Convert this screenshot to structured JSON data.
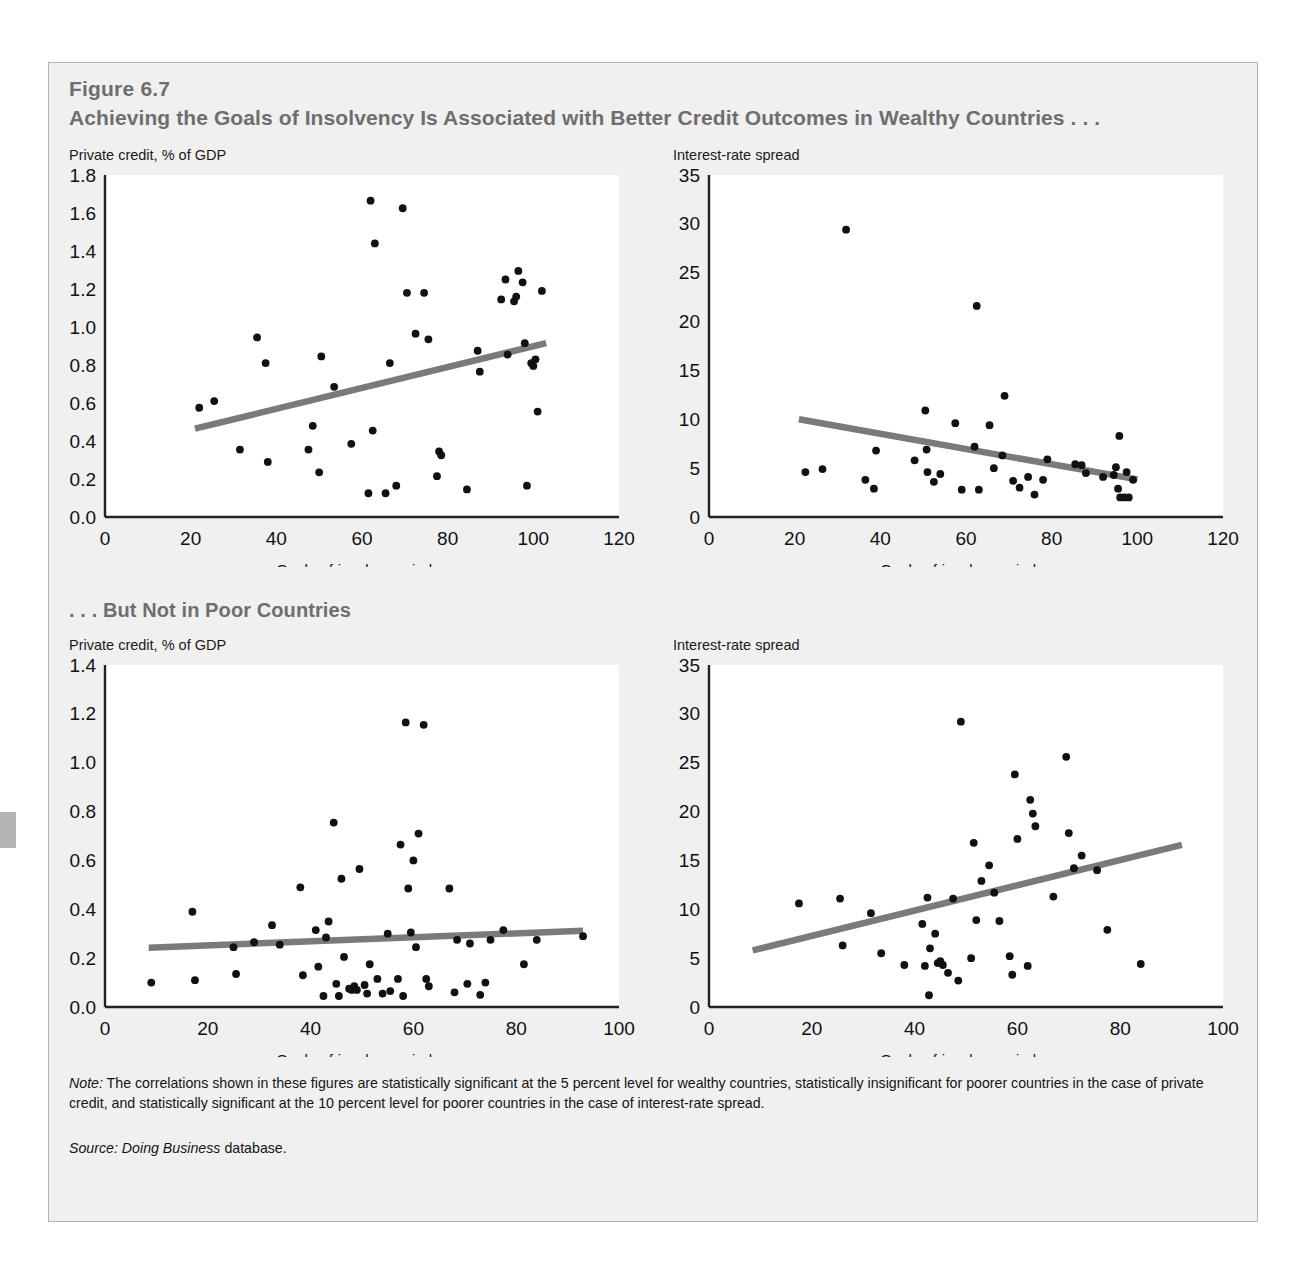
{
  "figure": {
    "number": "Figure 6.7",
    "title": "Achieving the Goals of Insolvency Is Associated with Better Credit Outcomes in Wealthy Countries . . .",
    "section_title": ". . . But Not in Poor Countries",
    "note_label": "Note:",
    "note_text": " The correlations shown in these figures are statistically significant at the 5 percent level for wealthy countries, statistically insignificant for poorer countries in the case of private credit, and statistically significant at the 10 percent level for poorer countries in the case of interest-rate spread.",
    "source_label": "Source:",
    "source_italic": " Doing Business",
    "source_text": " database."
  },
  "colors": {
    "panel_bg": "#f0f0f0",
    "panel_border": "#b3b3b3",
    "heading": "#6e6e6e",
    "axis": "#222222",
    "point": "#111111",
    "trendline": "#7a7a7a",
    "plot_bg": "#ffffff"
  },
  "chart_data": [
    {
      "id": "wealthy-private-credit",
      "type": "scatter",
      "title": "Private credit, % of GDP",
      "panel": "top-left",
      "xlabel": "Goals-of-insolvency index",
      "ylabel": "Private credit, % of GDP",
      "xlim": [
        0,
        120
      ],
      "ylim": [
        0,
        1.8
      ],
      "xticks": [
        0,
        20,
        40,
        60,
        80,
        100,
        120
      ],
      "yticks": [
        "0.0",
        "0.2",
        "0.4",
        "0.6",
        "0.8",
        "1.0",
        "1.2",
        "1.4",
        "1.6",
        "1.8"
      ],
      "grid": false,
      "legend": "none",
      "trendline": {
        "x0": 21,
        "y0": 0.465,
        "x1": 103,
        "y1": 0.915
      },
      "points": [
        [
          22,
          0.575
        ],
        [
          25.5,
          0.61
        ],
        [
          31.5,
          0.355
        ],
        [
          35.5,
          0.945
        ],
        [
          37.5,
          0.81
        ],
        [
          38,
          0.29
        ],
        [
          47.5,
          0.355
        ],
        [
          48.5,
          0.48
        ],
        [
          50,
          0.235
        ],
        [
          50.5,
          0.845
        ],
        [
          53.5,
          0.685
        ],
        [
          57.5,
          0.385
        ],
        [
          61.5,
          0.125
        ],
        [
          62,
          1.665
        ],
        [
          62.5,
          0.455
        ],
        [
          63,
          1.44
        ],
        [
          65.5,
          0.125
        ],
        [
          66.5,
          0.81
        ],
        [
          68,
          0.165
        ],
        [
          69.5,
          1.625
        ],
        [
          70.5,
          1.18
        ],
        [
          72.5,
          0.965
        ],
        [
          74.5,
          1.18
        ],
        [
          75.5,
          0.935
        ],
        [
          77.5,
          0.215
        ],
        [
          78,
          0.345
        ],
        [
          78.5,
          0.325
        ],
        [
          84.5,
          0.145
        ],
        [
          87,
          0.875
        ],
        [
          87.5,
          0.765
        ],
        [
          92.5,
          1.145
        ],
        [
          93.5,
          1.25
        ],
        [
          94,
          0.855
        ],
        [
          95.5,
          1.135
        ],
        [
          96,
          1.16
        ],
        [
          96.5,
          1.295
        ],
        [
          97.5,
          1.235
        ],
        [
          98,
          0.915
        ],
        [
          98.5,
          0.165
        ],
        [
          99.5,
          0.81
        ],
        [
          100,
          0.795
        ],
        [
          100.5,
          0.83
        ],
        [
          101,
          0.555
        ],
        [
          102,
          1.19
        ]
      ]
    },
    {
      "id": "wealthy-interest-rate-spread",
      "type": "scatter",
      "title": "Interest-rate spread",
      "panel": "top-right",
      "xlabel": "Goals-of-insolvency index",
      "ylabel": "Interest-rate spread",
      "xlim": [
        0,
        120
      ],
      "ylim": [
        0,
        35
      ],
      "xticks": [
        0,
        20,
        40,
        60,
        80,
        100,
        120
      ],
      "yticks": [
        0,
        5,
        10,
        15,
        20,
        25,
        30,
        35
      ],
      "grid": false,
      "legend": "none",
      "trendline": {
        "x0": 21,
        "y0": 10.0,
        "x1": 100,
        "y1": 3.85
      },
      "points": [
        [
          22.5,
          4.6
        ],
        [
          26.5,
          4.9
        ],
        [
          32,
          29.4
        ],
        [
          36.5,
          3.8
        ],
        [
          38.5,
          2.9
        ],
        [
          39,
          6.8
        ],
        [
          48,
          5.8
        ],
        [
          50.5,
          10.9
        ],
        [
          50.8,
          6.9
        ],
        [
          51,
          4.6
        ],
        [
          52.5,
          3.6
        ],
        [
          54,
          4.4
        ],
        [
          57.5,
          9.6
        ],
        [
          59,
          2.8
        ],
        [
          62,
          7.2
        ],
        [
          62.5,
          21.6
        ],
        [
          63,
          2.8
        ],
        [
          65.5,
          9.4
        ],
        [
          66.5,
          5.0
        ],
        [
          68.5,
          6.3
        ],
        [
          69,
          12.4
        ],
        [
          71,
          3.7
        ],
        [
          72.5,
          3.0
        ],
        [
          74.5,
          4.1
        ],
        [
          76,
          2.3
        ],
        [
          78,
          3.8
        ],
        [
          79,
          5.9
        ],
        [
          85.5,
          5.4
        ],
        [
          87,
          5.3
        ],
        [
          88,
          4.5
        ],
        [
          92,
          4.1
        ],
        [
          94.5,
          4.3
        ],
        [
          95,
          5.1
        ],
        [
          95.5,
          2.9
        ],
        [
          95.8,
          8.3
        ],
        [
          96,
          2.0
        ],
        [
          97,
          2.0
        ],
        [
          97.5,
          4.6
        ],
        [
          98,
          2.0
        ],
        [
          99,
          3.8
        ]
      ]
    },
    {
      "id": "poor-private-credit",
      "type": "scatter",
      "title": "Private credit, % of GDP",
      "panel": "bottom-left",
      "xlabel": "Goals-of-insolvency index",
      "ylabel": "Private credit, % of GDP",
      "xlim": [
        0,
        100
      ],
      "ylim": [
        0,
        1.4
      ],
      "xticks": [
        0,
        20,
        40,
        60,
        80,
        100
      ],
      "yticks": [
        "0.0",
        "0.2",
        "0.4",
        "0.6",
        "0.8",
        "1.0",
        "1.2",
        "1.4"
      ],
      "grid": false,
      "legend": "none",
      "trendline": {
        "x0": 8.5,
        "y0": 0.243,
        "x1": 93,
        "y1": 0.312
      },
      "points": [
        [
          9,
          0.1
        ],
        [
          17,
          0.39
        ],
        [
          17.5,
          0.11
        ],
        [
          25,
          0.245
        ],
        [
          25.5,
          0.135
        ],
        [
          29,
          0.265
        ],
        [
          32.5,
          0.335
        ],
        [
          34,
          0.255
        ],
        [
          38,
          0.49
        ],
        [
          38.5,
          0.13
        ],
        [
          41,
          0.315
        ],
        [
          41.5,
          0.165
        ],
        [
          42.5,
          0.045
        ],
        [
          43,
          0.285
        ],
        [
          43.5,
          0.35
        ],
        [
          44.5,
          0.755
        ],
        [
          45,
          0.095
        ],
        [
          45.5,
          0.045
        ],
        [
          46,
          0.525
        ],
        [
          46.5,
          0.205
        ],
        [
          47.5,
          0.075
        ],
        [
          48,
          0.07
        ],
        [
          48.5,
          0.085
        ],
        [
          49,
          0.07
        ],
        [
          49.5,
          0.565
        ],
        [
          50.5,
          0.09
        ],
        [
          51,
          0.055
        ],
        [
          51.5,
          0.175
        ],
        [
          53,
          0.115
        ],
        [
          54,
          0.055
        ],
        [
          55,
          0.3
        ],
        [
          55.5,
          0.065
        ],
        [
          57,
          0.115
        ],
        [
          57.5,
          0.665
        ],
        [
          58,
          0.045
        ],
        [
          58.5,
          1.165
        ],
        [
          59,
          0.485
        ],
        [
          59.5,
          0.305
        ],
        [
          60,
          0.6
        ],
        [
          60.5,
          0.245
        ],
        [
          61,
          0.71
        ],
        [
          62,
          1.155
        ],
        [
          62.5,
          0.115
        ],
        [
          63,
          0.085
        ],
        [
          67,
          0.485
        ],
        [
          68,
          0.06
        ],
        [
          68.5,
          0.275
        ],
        [
          70.5,
          0.095
        ],
        [
          71,
          0.26
        ],
        [
          73,
          0.05
        ],
        [
          74,
          0.1
        ],
        [
          75,
          0.275
        ],
        [
          77.5,
          0.315
        ],
        [
          81.5,
          0.175
        ],
        [
          84,
          0.275
        ],
        [
          93,
          0.29
        ]
      ]
    },
    {
      "id": "poor-interest-rate-spread",
      "type": "scatter",
      "title": "Interest-rate spread",
      "panel": "bottom-right",
      "xlabel": "Goals-of-insolvency index",
      "ylabel": "Interest-rate spread",
      "xlim": [
        0,
        100
      ],
      "ylim": [
        0,
        35
      ],
      "xticks": [
        0,
        20,
        40,
        60,
        80,
        100
      ],
      "yticks": [
        0,
        5,
        10,
        15,
        20,
        25,
        30,
        35
      ],
      "grid": false,
      "legend": "none",
      "trendline": {
        "x0": 8.5,
        "y0": 5.8,
        "x1": 92,
        "y1": 16.6
      },
      "points": [
        [
          17.5,
          10.6
        ],
        [
          25.5,
          11.1
        ],
        [
          26,
          6.3
        ],
        [
          31.5,
          9.6
        ],
        [
          33.5,
          5.5
        ],
        [
          38,
          4.3
        ],
        [
          41.5,
          8.5
        ],
        [
          42,
          4.2
        ],
        [
          42.5,
          11.2
        ],
        [
          42.8,
          1.2
        ],
        [
          43,
          6.0
        ],
        [
          44,
          7.5
        ],
        [
          44.5,
          4.5
        ],
        [
          45,
          4.7
        ],
        [
          45.5,
          4.3
        ],
        [
          46.5,
          3.5
        ],
        [
          47.5,
          11.1
        ],
        [
          48.5,
          2.7
        ],
        [
          49,
          29.2
        ],
        [
          51,
          5.0
        ],
        [
          51.5,
          16.8
        ],
        [
          52,
          8.9
        ],
        [
          53,
          12.9
        ],
        [
          54.5,
          14.5
        ],
        [
          55.5,
          11.7
        ],
        [
          56.5,
          8.8
        ],
        [
          58.5,
          5.2
        ],
        [
          59,
          3.3
        ],
        [
          59.5,
          23.8
        ],
        [
          60,
          17.2
        ],
        [
          62,
          4.2
        ],
        [
          62.5,
          21.2
        ],
        [
          63,
          19.8
        ],
        [
          63.5,
          18.5
        ],
        [
          67,
          11.3
        ],
        [
          69.5,
          25.6
        ],
        [
          70,
          17.8
        ],
        [
          71,
          14.2
        ],
        [
          72.5,
          15.5
        ],
        [
          75.5,
          14.0
        ],
        [
          77.5,
          7.9
        ],
        [
          84,
          4.4
        ]
      ]
    }
  ]
}
